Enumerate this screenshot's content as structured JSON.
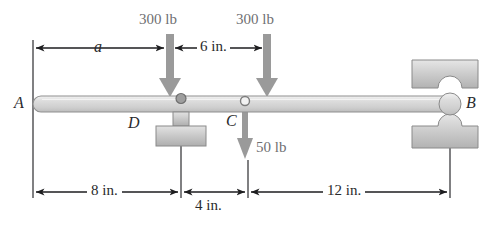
{
  "figure": {
    "colors": {
      "beam_fill": "#d9d9d9",
      "beam_edge": "#8a8a8a",
      "block_fill": "#c9c9c9",
      "block_edge": "#8a8a8a",
      "load_arrow": "#9a9a9a",
      "dim_line": "#1d1d1f",
      "extension_line": "#4a4a4d",
      "background": "#ffffff"
    }
  },
  "loads": [
    {
      "id": "load-left",
      "label": "300 lb",
      "x": 170,
      "arrow_top": 34,
      "arrow_tip": 96
    },
    {
      "id": "load-right",
      "label": "300 lb",
      "x": 267,
      "arrow_top": 34,
      "arrow_tip": 96
    },
    {
      "id": "load-c",
      "label": "50 lb",
      "x": 245,
      "arrow_top": 104,
      "arrow_tip": 160
    }
  ],
  "top_dimensions": [
    {
      "id": "dim-a",
      "label": "a",
      "from_x": 28,
      "to_x": 168,
      "y": 48
    },
    {
      "id": "dim-6in",
      "label": "6 in.",
      "from_x": 172,
      "to_x": 265,
      "y": 48
    }
  ],
  "bottom_dimensions": [
    {
      "id": "dim-8in",
      "label": "8 in.",
      "from_x": 36,
      "to_x": 180,
      "y": 192
    },
    {
      "id": "dim-4in",
      "label": "4 in.",
      "from_x": 182,
      "to_x": 247,
      "y": 192
    },
    {
      "id": "dim-12in",
      "label": "12 in.",
      "from_x": 249,
      "to_x": 450,
      "y": 192
    }
  ],
  "points": [
    {
      "id": "point-A",
      "label": "A",
      "x": 14,
      "y": 96
    },
    {
      "id": "point-B",
      "label": "B",
      "x": 463,
      "y": 96
    },
    {
      "id": "point-C",
      "label": "C",
      "x": 228,
      "y": 112
    },
    {
      "id": "point-D",
      "label": "D",
      "x": 128,
      "y": 114
    }
  ],
  "beam": {
    "left_x": 33,
    "right_x": 452,
    "top_y": 96,
    "bottom_y": 112
  },
  "supports": [
    {
      "id": "support-D",
      "type": "pin-on-pedestal",
      "x": 180,
      "label": "D"
    },
    {
      "id": "support-B",
      "type": "bearing-collar",
      "x": 450,
      "label": "B"
    }
  ],
  "hinge": {
    "id": "hinge-C",
    "type": "pin-joint",
    "x": 245
  }
}
